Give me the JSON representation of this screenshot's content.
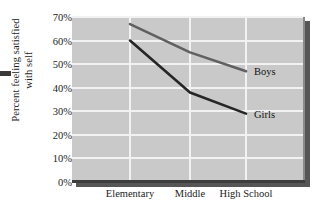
{
  "chart_data": {
    "type": "line",
    "title": "",
    "xlabel": "",
    "ylabel": "Percent feeling satisfied with self",
    "ylabel_line1": "Percent feeling satisfied",
    "ylabel_line2": "with self",
    "categories": [
      "Elementary",
      "Middle",
      "High School"
    ],
    "series": [
      {
        "name": "Boys",
        "values": [
          67,
          55,
          47
        ],
        "color": "#606060"
      },
      {
        "name": "Girls",
        "values": [
          60,
          38,
          29
        ],
        "color": "#262626"
      }
    ],
    "ylim": [
      0,
      70
    ],
    "ytick_labels": [
      "0%",
      "10%",
      "20%",
      "30%",
      "40%",
      "50%",
      "60%",
      "70%"
    ],
    "ytick_values": [
      0,
      10,
      20,
      30,
      40,
      50,
      60,
      70
    ],
    "grid": true,
    "legend_position": "inline-right-of-line-ends",
    "plot_background": "#c9c9c9",
    "gridline_color": "#f2f2f2"
  }
}
